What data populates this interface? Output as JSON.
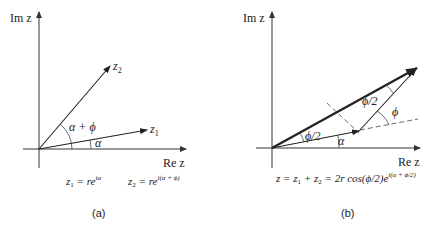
{
  "panel_a": {
    "caption": "(a)",
    "axis_y_label": "Im z",
    "axis_x_label": "Re z",
    "vector_1_label": "z",
    "vector_1_sub": "1",
    "vector_2_label": "z",
    "vector_2_sub": "2",
    "angle_alpha": "α",
    "angle_alpha_phi": "α + ϕ",
    "formula_1_lhs": "z",
    "formula_1_sub": "1",
    "formula_1_rhs": " = re",
    "formula_1_exp": "iα",
    "formula_2_lhs": "z",
    "formula_2_sub": "2",
    "formula_2_rhs": " = re",
    "formula_2_exp": "i(α + ϕ)"
  },
  "panel_b": {
    "caption": "(b)",
    "axis_y_label": "Im z",
    "axis_x_label": "Re z",
    "angle_alpha": "α",
    "angle_phi": "ϕ",
    "angle_half_phi_lower": "ϕ/2",
    "angle_half_phi_upper": "ϕ/2",
    "formula_main": "z = z",
    "formula_sub1": "1",
    "formula_plus": " + z",
    "formula_sub2": "2",
    "formula_rest": " = 2r cos(ϕ/2)e",
    "formula_exp": "i(α + ϕ/2)"
  }
}
